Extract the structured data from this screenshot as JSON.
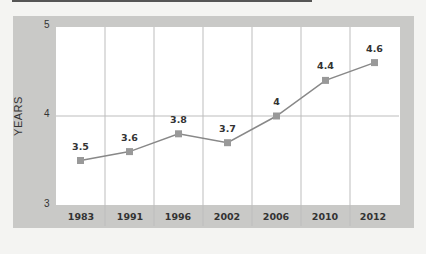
{
  "chart_data": {
    "type": "line",
    "title": "",
    "xlabel": "",
    "ylabel": "YEARS",
    "categories": [
      "1983",
      "1991",
      "1996",
      "2002",
      "2006",
      "2010",
      "2012"
    ],
    "values": [
      3.5,
      3.6,
      3.8,
      3.7,
      4,
      4.4,
      4.6
    ],
    "data_labels": [
      "3.5",
      "3.6",
      "3.8",
      "3.7",
      "4",
      "4.4",
      "4.6"
    ],
    "ylim": [
      3,
      5
    ],
    "yticks": [
      "3",
      "4",
      "5"
    ],
    "grid": true,
    "legend": null,
    "colors": {
      "line": "#888888",
      "marker": "#999999",
      "panel": "#c9c9c7",
      "plot_bg": "#ffffff"
    }
  }
}
